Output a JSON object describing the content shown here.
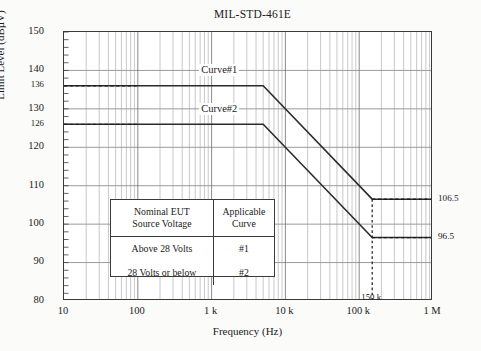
{
  "chart_data": {
    "type": "line",
    "title": "MIL-STD-461E",
    "xlabel": "Frequency (Hz)",
    "ylabel": "Limit Level (dBµV)",
    "xscale": "log",
    "xlim": [
      10,
      1000000
    ],
    "ylim": [
      80,
      150
    ],
    "grid": true,
    "legend_position": "inside-table",
    "xticks": [
      {
        "value": 10,
        "label": "10"
      },
      {
        "value": 100,
        "label": "100"
      },
      {
        "value": 1000,
        "label": "1 k"
      },
      {
        "value": 10000,
        "label": "10 k"
      },
      {
        "value": 100000,
        "label": "100 k"
      },
      {
        "value": 1000000,
        "label": "1 M"
      }
    ],
    "xticks_secondary": [
      {
        "value": 150000,
        "label": "150 k"
      }
    ],
    "yticks": [
      {
        "value": 80,
        "label": "80",
        "size": "normal"
      },
      {
        "value": 90,
        "label": "90",
        "size": "normal"
      },
      {
        "value": 100,
        "label": "100",
        "size": "normal"
      },
      {
        "value": 110,
        "label": "110",
        "size": "normal"
      },
      {
        "value": 120,
        "label": "120",
        "size": "normal"
      },
      {
        "value": 126,
        "label": "126",
        "size": "small"
      },
      {
        "value": 130,
        "label": "130",
        "size": "normal"
      },
      {
        "value": 136,
        "label": "136",
        "size": "small"
      },
      {
        "value": 140,
        "label": "140",
        "size": "normal"
      },
      {
        "value": 150,
        "label": "150",
        "size": "normal"
      }
    ],
    "series": [
      {
        "name": "Curve#1",
        "label": "Curve#1",
        "points": [
          {
            "x": 10,
            "y": 136
          },
          {
            "x": 5000,
            "y": 136
          },
          {
            "x": 150000,
            "y": 106.5
          },
          {
            "x": 1000000,
            "y": 106.5
          }
        ]
      },
      {
        "name": "Curve#2",
        "label": "Curve#2",
        "points": [
          {
            "x": 10,
            "y": 126
          },
          {
            "x": 5000,
            "y": 126
          },
          {
            "x": 150000,
            "y": 96.5
          },
          {
            "x": 1000000,
            "y": 96.5
          }
        ]
      }
    ],
    "annotations": [
      {
        "name": "curve1-level",
        "value": 136,
        "label": "136",
        "kind": "y-dashed-left"
      },
      {
        "name": "curve2-level",
        "value": 126,
        "label": "126",
        "kind": "y-dashed-left"
      },
      {
        "name": "curve1-endpoint",
        "value": 106.5,
        "label": "106.5",
        "kind": "y-dashed-right"
      },
      {
        "name": "curve2-endpoint",
        "value": 96.5,
        "label": "96.5",
        "kind": "y-dashed-right"
      },
      {
        "name": "breakpoint-frequency",
        "value": 150000,
        "label": "150 k",
        "kind": "x-dashed"
      }
    ],
    "right_labels": [
      {
        "label": "106.5",
        "y": 106.5
      },
      {
        "label": "96.5",
        "y": 96.5
      }
    ],
    "curve_labels": [
      {
        "label": "Curve#1",
        "x": 700,
        "y": 139.8
      },
      {
        "label": "Curve#2",
        "x": 700,
        "y": 129.5
      }
    ]
  },
  "legend_table": {
    "headers": [
      [
        "Nominal EUT",
        "Source Voltage"
      ],
      [
        "Applicable",
        "Curve"
      ]
    ],
    "rows": [
      [
        "Above 28 Volts",
        "#1"
      ],
      [
        "28 Volts or below",
        "#2"
      ]
    ]
  },
  "colors": {
    "background": "#fbfbfa",
    "plot_background": "#ffffff",
    "axis": "#3a3a3a",
    "major_grid": "#6e6e6e",
    "minor_grid": "#9a9a9a",
    "curve": "#2b2b2b",
    "dashed": "#1a1a1a",
    "text": "#1a1a1a"
  }
}
